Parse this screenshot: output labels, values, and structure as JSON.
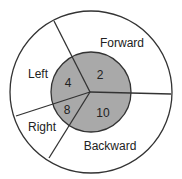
{
  "diagram": {
    "outer_labels": {
      "forward": "Forward",
      "left": "Left",
      "right": "Right",
      "backward": "Backward"
    },
    "inner_values": {
      "forward": "2",
      "left": "4",
      "right": "8",
      "backward": "10"
    },
    "colors": {
      "inner_fill": "#a9a9a9",
      "outer_fill": "#ffffff",
      "stroke": "#333333"
    }
  }
}
